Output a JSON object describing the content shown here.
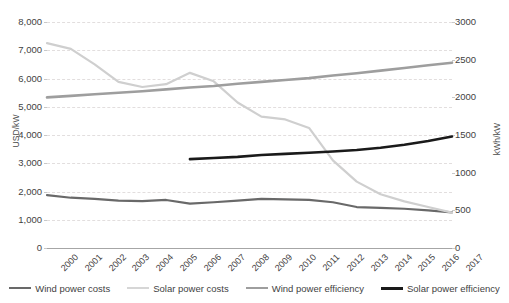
{
  "chart_data": {
    "type": "line",
    "title": "",
    "subtitle": "",
    "xlabel": "",
    "ylabel": "USD/kW",
    "y2label": "kWh/kW",
    "grid": true,
    "legend_position": "bottom",
    "x": [
      "2000",
      "2001",
      "2002",
      "2003",
      "2004",
      "2005",
      "2006",
      "2007",
      "2008",
      "2009",
      "2010",
      "2011",
      "2012",
      "2013",
      "2014",
      "2015",
      "2016",
      "2017"
    ],
    "ylim": [
      0,
      8000
    ],
    "y_ticks": [
      "0",
      "1,000",
      "2,000",
      "3,000",
      "4,000",
      "5,000",
      "6,000",
      "7,000",
      "8,000"
    ],
    "y2lim": [
      0,
      3000
    ],
    "y2_ticks": [
      "0",
      "500",
      "1000",
      "1500",
      "2000",
      "2500",
      "3000"
    ],
    "series": [
      {
        "name": "Wind power costs",
        "axis": "left",
        "unit": "USD/kW",
        "color": "#696969",
        "width": 2.2,
        "values": [
          1870,
          1780,
          1740,
          1680,
          1660,
          1700,
          1570,
          1620,
          1680,
          1740,
          1720,
          1700,
          1620,
          1450,
          1420,
          1390,
          1330,
          1260
        ]
      },
      {
        "name": "Solar power costs",
        "axis": "left",
        "unit": "USD/kW",
        "color": "#cfcfcf",
        "width": 2.2,
        "values": [
          7250,
          7050,
          6500,
          5880,
          5700,
          5800,
          6200,
          5900,
          5150,
          4650,
          4550,
          4250,
          3100,
          2350,
          1900,
          1650,
          1450,
          1250
        ]
      },
      {
        "name": "Wind power efficiency",
        "axis": "right",
        "unit": "kWh/kW",
        "color": "#9e9e9e",
        "width": 2.6,
        "values": [
          2000,
          2020,
          2040,
          2060,
          2080,
          2105,
          2130,
          2150,
          2180,
          2205,
          2230,
          2255,
          2290,
          2320,
          2355,
          2390,
          2425,
          2460
        ]
      },
      {
        "name": "Solar power efficiency",
        "axis": "right",
        "unit": "kWh/kW",
        "color": "#1a1a1a",
        "width": 2.6,
        "values": [
          null,
          null,
          null,
          null,
          null,
          null,
          1180,
          1195,
          1210,
          1235,
          1250,
          1265,
          1280,
          1300,
          1330,
          1370,
          1420,
          1480
        ]
      }
    ]
  },
  "axes": {
    "left": {
      "title": "USD/kW"
    },
    "right": {
      "title": "kWh/kW"
    }
  },
  "legend": {
    "items": [
      {
        "label": "Wind power costs",
        "color": "#696969",
        "thickness": "2.4px"
      },
      {
        "label": "Solar power costs",
        "color": "#d6d6d6",
        "thickness": "2.2px"
      },
      {
        "label": "Wind power efficiency",
        "color": "#9e9e9e",
        "thickness": "2.4px"
      },
      {
        "label": "Solar power efficiency",
        "color": "#1a1a1a",
        "thickness": "3px"
      }
    ]
  }
}
